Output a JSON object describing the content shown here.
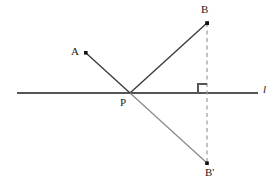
{
  "figure": {
    "background": "#ffffff",
    "width": 278,
    "height": 188,
    "colors": {
      "line_l": "#555555",
      "segment_dark": "#3a3a3a",
      "segment_light": "#888888",
      "dashed": "#9a9a9a",
      "label": "#1a1a1a",
      "point_fill": "#111111"
    },
    "labels": {
      "point_a": "A",
      "point_b": "B",
      "point_p": "P",
      "point_b_prime": "B'",
      "line_l": "l"
    },
    "points": [
      {
        "name": "A",
        "label": "A",
        "x": 86,
        "y": 53,
        "label_x": 71,
        "label_y": 46,
        "marker": true
      },
      {
        "name": "B",
        "label": "B",
        "x": 207,
        "y": 23,
        "label_x": 201,
        "label_y": 4,
        "marker": true
      },
      {
        "name": "P",
        "label": "P",
        "x": 130,
        "y": 93,
        "label_x": 120,
        "label_y": 97,
        "marker": false
      },
      {
        "name": "B'",
        "label": "B'",
        "x": 207,
        "y": 163,
        "label_x": 205,
        "label_y": 167,
        "marker": true
      }
    ],
    "segments": [
      {
        "name": "line-l",
        "x1": 17,
        "y1": 93,
        "x2": 258,
        "y2": 93,
        "style": "solid",
        "color": "#555555",
        "width": 1.1
      },
      {
        "name": "segment-ap",
        "x1": 86,
        "y1": 53,
        "x2": 130,
        "y2": 93,
        "style": "solid",
        "color": "#3a3a3a",
        "width": 1.3
      },
      {
        "name": "segment-pb",
        "x1": 130,
        "y1": 93,
        "x2": 207,
        "y2": 23,
        "style": "solid",
        "color": "#3a3a3a",
        "width": 1.3
      },
      {
        "name": "segment-pbprime",
        "x1": 130,
        "y1": 93,
        "x2": 207,
        "y2": 163,
        "style": "solid",
        "color": "#888888",
        "width": 1.2
      },
      {
        "name": "dashed-bbprime",
        "x1": 207,
        "y1": 23,
        "x2": 207,
        "y2": 163,
        "style": "dashed",
        "color": "#9a9a9a",
        "width": 1.2
      }
    ],
    "right_angle": {
      "name": "right-angle-marker",
      "corner_x": 207,
      "corner_y": 93,
      "size": 9,
      "direction": "left-up",
      "color": "#555555"
    },
    "line_label": {
      "text": "l",
      "x": 263,
      "y": 84
    }
  }
}
